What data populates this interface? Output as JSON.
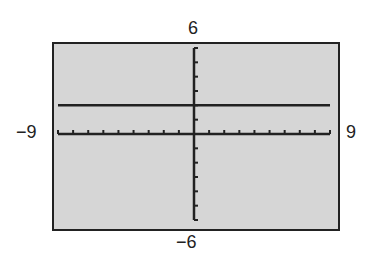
{
  "chart_data": {
    "type": "line",
    "title": "",
    "xlabel": "",
    "ylabel": "",
    "xlim": [
      -9,
      9
    ],
    "ylim": [
      -6,
      6
    ],
    "xscale": 1,
    "yscale": 1,
    "grid": false,
    "series": [
      {
        "name": "y = 2",
        "x": [
          -9,
          9
        ],
        "y": [
          2,
          2
        ]
      }
    ],
    "window_labels": {
      "ymax": "6",
      "ymin": "−6",
      "xmin": "−9",
      "xmax": "9"
    }
  },
  "colors": {
    "screen": "#d6d6d6",
    "ink": "#222222"
  }
}
